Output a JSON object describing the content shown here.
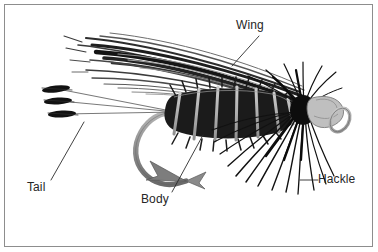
{
  "figure": {
    "background_color": "#ffffff",
    "frame_color": "#8d8d8d",
    "ink_color": "#1a1a1a",
    "mid_gray": "#8a8a8a",
    "light_gray": "#bdbdbd",
    "label_color": "#262626"
  },
  "labels": [
    {
      "id": "wing",
      "text": "Wing",
      "leader": "diagonal-down-left"
    },
    {
      "id": "tail",
      "text": "Tail",
      "leader": "diagonal-up-right"
    },
    {
      "id": "body",
      "text": "Body",
      "leader": "diagonal-up-right"
    },
    {
      "id": "hackle",
      "text": "Hackle",
      "leader": "horizontal-left"
    }
  ],
  "parts": {
    "wing": "wing-feather-fibers",
    "tail": "tail-fibers",
    "body": "ribbed-dubbed-body",
    "hackle": "hackle-collar-fibers",
    "hook": "hook-bend-and-point",
    "head": "head-and-eye"
  }
}
